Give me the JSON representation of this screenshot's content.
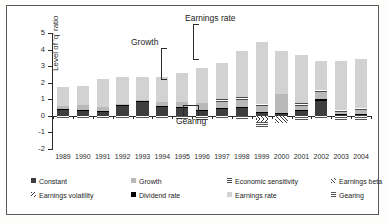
{
  "chart_data": {
    "type": "bar",
    "stacked": true,
    "title": "",
    "xlabel": "",
    "ylabel": "Level of 'q' ratio",
    "ylim": [
      -2,
      5
    ],
    "yticks": [
      "5",
      "4",
      "3",
      "2",
      "1",
      "0",
      "-1",
      "-2"
    ],
    "grid": false,
    "legend_position": "bottom",
    "categories": [
      "1989",
      "1990",
      "1991",
      "1992",
      "1993",
      "1994",
      "1995",
      "1996",
      "1997",
      "1998",
      "1999",
      "2000",
      "2001",
      "2002",
      "2003",
      "2004"
    ],
    "series": [
      {
        "name": "Constant",
        "fill": "solid-dark-grey",
        "color": "#3e3e3e",
        "values": [
          0.38,
          0.32,
          0.28,
          0.6,
          0.86,
          0.58,
          0.5,
          0.28,
          0.42,
          0.5,
          0.18,
          0.12,
          0.34,
          0.9,
          0.1,
          0.1
        ]
      },
      {
        "name": "Dividend rate",
        "fill": "solid-black",
        "color": "#000000",
        "values": [
          0.02,
          0.02,
          0.02,
          0.1,
          0.06,
          0.04,
          0.04,
          0.06,
          0.04,
          0.06,
          0.04,
          0.04,
          0.04,
          0.1,
          0.04,
          0.04
        ]
      },
      {
        "name": "Growth",
        "fill": "solid-mid-grey",
        "color": "#b9b9b9",
        "values": [
          0.18,
          0.3,
          0.22,
          0.04,
          0.04,
          0.2,
          0.28,
          0.44,
          0.36,
          0.38,
          0.36,
          1.14,
          0.22,
          0.44,
          0.08,
          0.2
        ]
      },
      {
        "name": "Economic sensitivity",
        "fill": "fine-horizontal-hatch",
        "color": "#4a4a4a",
        "values": [
          0.0,
          0.0,
          0.0,
          0.0,
          0.0,
          0.0,
          0.0,
          0.0,
          0.18,
          0.18,
          0.16,
          0.0,
          0.16,
          0.12,
          0.12,
          0.12
        ]
      },
      {
        "name": "Earnings rate",
        "fill": "solid-light-grey",
        "color": "#d2d2d2",
        "values": [
          1.18,
          1.18,
          1.68,
          1.62,
          1.38,
          1.5,
          1.78,
          2.12,
          2.22,
          2.78,
          3.74,
          2.62,
          2.94,
          1.74,
          2.96,
          2.96
        ]
      },
      {
        "name": "Earnings beta",
        "fill": "diagonal-hatch-up",
        "color": "#3a3a3a",
        "values": [
          0.0,
          0.0,
          0.0,
          0.0,
          0.0,
          0.0,
          0.0,
          0.0,
          0.0,
          0.0,
          -0.18,
          -0.42,
          0.0,
          0.0,
          0.0,
          0.0
        ]
      },
      {
        "name": "Earnings volatility",
        "fill": "diagonal-hatch-down",
        "color": "#3a3a3a",
        "values": [
          0.0,
          0.0,
          0.0,
          0.0,
          0.0,
          0.0,
          0.0,
          0.0,
          0.0,
          0.0,
          -0.18,
          0.0,
          0.0,
          0.0,
          0.0,
          0.0
        ]
      },
      {
        "name": "Gearing",
        "fill": "fine-horizontal-hatch-light",
        "color": "#555555",
        "values": [
          -0.1,
          -0.1,
          -0.1,
          -0.1,
          -0.1,
          -0.1,
          -0.16,
          -0.22,
          -0.12,
          -0.2,
          -0.3,
          0.0,
          -0.24,
          -0.14,
          -0.24,
          -0.24
        ]
      }
    ],
    "totals": [
      1.76,
      1.82,
      2.2,
      2.36,
      2.34,
      2.32,
      2.6,
      2.9,
      3.22,
      3.9,
      4.48,
      3.92,
      3.7,
      3.3,
      3.3,
      3.42
    ],
    "annotations": [
      {
        "label": "Earnings rate",
        "target_year": "1997"
      },
      {
        "label": "Growth",
        "target_year": "1996"
      },
      {
        "label": "Gearing",
        "target_year": "1997"
      }
    ]
  },
  "axis": {
    "y_title": "Level of 'q' ratio",
    "y_tick_labels": [
      "5",
      "4",
      "3",
      "2",
      "1",
      "0",
      "-1",
      "-2"
    ],
    "x_tick_labels": [
      "1989",
      "1990",
      "1991",
      "1992",
      "1993",
      "1994",
      "1995",
      "1996",
      "1997",
      "1998",
      "1999",
      "2000",
      "2001",
      "2002",
      "2003",
      "2004"
    ]
  },
  "annotations": {
    "earnings_rate": "Earnings rate",
    "growth": "Growth",
    "gearing": "Gearing"
  },
  "legend": {
    "items": [
      {
        "label": "Constant",
        "swatch": "f-constant"
      },
      {
        "label": "Growth",
        "swatch": "f-growth"
      },
      {
        "label": "Economic sensitivity",
        "swatch": "f-econ"
      },
      {
        "label": "Earnings beta",
        "swatch": "f-ebeta"
      },
      {
        "label": "Earnings volatility",
        "swatch": "f-evol"
      },
      {
        "label": "Dividend rate",
        "swatch": "f-div"
      },
      {
        "label": "Earnings rate",
        "swatch": "f-erate"
      },
      {
        "label": "Gearing",
        "swatch": "f-gearing"
      }
    ]
  },
  "colors": {
    "constant": "#3e3e3e",
    "growth": "#b9b9b9",
    "earnings_rate": "#d2d2d2",
    "dividend_rate": "#000000",
    "frame": "#5a5a5a",
    "axis": "#2b2b2b"
  }
}
